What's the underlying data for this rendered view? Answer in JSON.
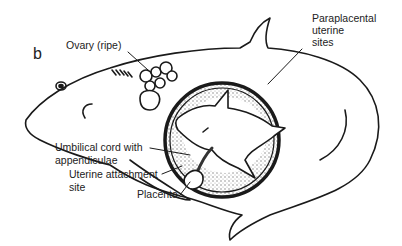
{
  "figure": {
    "panel_letter": "b",
    "labels": {
      "ovary": "Ovary (ripe)",
      "paraplacental_line1": "Paraplacental",
      "paraplacental_line2": "uterine",
      "paraplacental_line3": "sites",
      "umbilical_line1": "Umbilical cord with",
      "umbilical_line2": "appendiculae",
      "uterine_line1": "Uterine attachment",
      "uterine_line2": "site",
      "placenta": "Placenta"
    },
    "colors": {
      "ink": "#1a1a1a",
      "background": "#ffffff",
      "stipple": "#9a9a9a"
    }
  }
}
